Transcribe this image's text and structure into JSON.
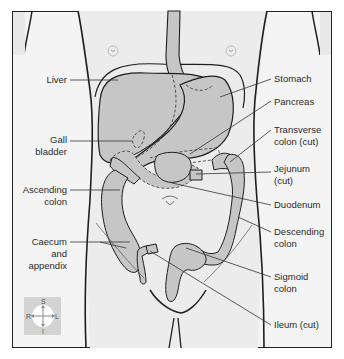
{
  "diagram": {
    "colors": {
      "organ_fill": "#c6c6c6",
      "body_fill": "#ececec",
      "background": "#f4f4f4",
      "outline": "#1e1e1e",
      "leader": "#333333"
    },
    "labels_left": [
      {
        "id": "liver",
        "text": "Liver"
      },
      {
        "id": "gall-bladder-1",
        "text": "Gall"
      },
      {
        "id": "gall-bladder-2",
        "text": "bladder"
      },
      {
        "id": "ascending-colon-1",
        "text": "Ascending"
      },
      {
        "id": "ascending-colon-2",
        "text": "colon"
      },
      {
        "id": "caecum-1",
        "text": "Caecum"
      },
      {
        "id": "caecum-2",
        "text": "and"
      },
      {
        "id": "caecum-3",
        "text": "appendix"
      }
    ],
    "labels_right": [
      {
        "id": "stomach",
        "text": "Stomach"
      },
      {
        "id": "pancreas",
        "text": "Pancreas"
      },
      {
        "id": "transverse-colon-1",
        "text": "Transverse"
      },
      {
        "id": "transverse-colon-2",
        "text": "colon (cut)"
      },
      {
        "id": "jejunum-1",
        "text": "Jejunum"
      },
      {
        "id": "jejunum-2",
        "text": "(cut)"
      },
      {
        "id": "duodenum",
        "text": "Duodenum"
      },
      {
        "id": "descending-colon-1",
        "text": "Descending"
      },
      {
        "id": "descending-colon-2",
        "text": "colon"
      },
      {
        "id": "sigmoid-colon-1",
        "text": "Sigmoid"
      },
      {
        "id": "sigmoid-colon-2",
        "text": "colon"
      },
      {
        "id": "ileum",
        "text": "Ileum (cut)"
      }
    ],
    "compass": {
      "superior": "S",
      "inferior": "I",
      "right": "R",
      "left": "L"
    }
  }
}
